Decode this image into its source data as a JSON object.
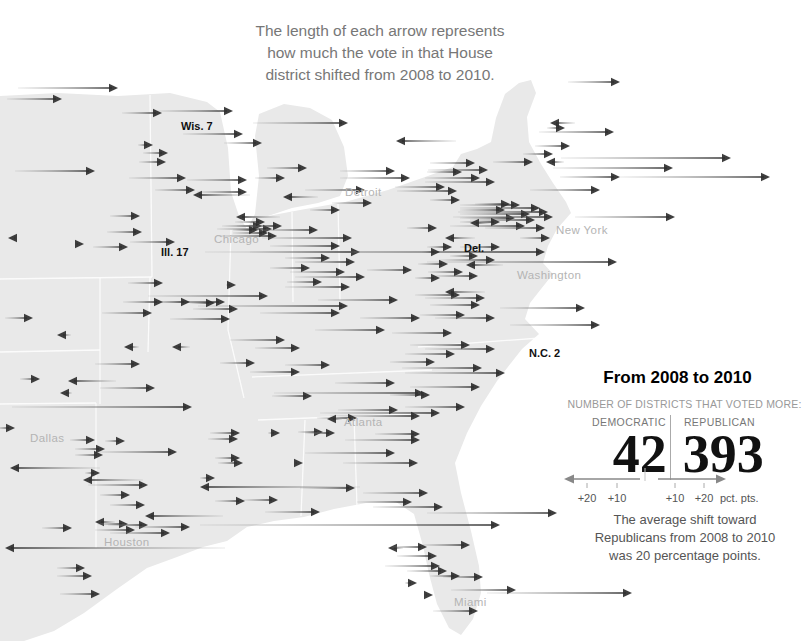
{
  "annotation": {
    "title": "The length of each arrow represents\nhow much the vote in that House\ndistrict shifted from 2008 to 2010."
  },
  "map": {
    "cities": [
      {
        "name": "Detroit",
        "x": 345,
        "y": 186
      },
      {
        "name": "Chicago",
        "x": 214,
        "y": 233
      },
      {
        "name": "New York",
        "x": 556,
        "y": 224
      },
      {
        "name": "Washington",
        "x": 517,
        "y": 269
      },
      {
        "name": "Atlanta",
        "x": 344,
        "y": 416
      },
      {
        "name": "Dallas",
        "x": 30,
        "y": 432
      },
      {
        "name": "Houston",
        "x": 104,
        "y": 536
      },
      {
        "name": "Miami",
        "x": 454,
        "y": 596
      }
    ],
    "districts": [
      {
        "name": "Wis. 7",
        "x": 181,
        "y": 120
      },
      {
        "name": "Ill. 17",
        "x": 161,
        "y": 246
      },
      {
        "name": "Del.",
        "x": 464,
        "y": 242
      },
      {
        "name": "N.C. 2",
        "x": 529,
        "y": 347
      }
    ]
  },
  "arrows": [
    [
      118,
      88,
      100,
      "R"
    ],
    [
      62,
      99,
      55,
      "R"
    ],
    [
      233,
      111,
      76,
      "R"
    ],
    [
      162,
      113,
      40,
      "R"
    ],
    [
      348,
      123,
      95,
      "R"
    ],
    [
      550,
      123,
      25,
      "L"
    ],
    [
      620,
      82,
      52,
      "R"
    ],
    [
      243,
      134,
      60,
      "R"
    ],
    [
      262,
      143,
      38,
      "R"
    ],
    [
      153,
      145,
      15,
      "R"
    ],
    [
      396,
      141,
      60,
      "L"
    ],
    [
      614,
      132,
      75,
      "R"
    ],
    [
      565,
      128,
      18,
      "R"
    ],
    [
      570,
      146,
      35,
      "R"
    ],
    [
      95,
      171,
      80,
      "R"
    ],
    [
      168,
      153,
      25,
      "R"
    ],
    [
      166,
      162,
      27,
      "R"
    ],
    [
      553,
      154,
      30,
      "R"
    ],
    [
      731,
      158,
      170,
      "R"
    ],
    [
      673,
      168,
      120,
      "R"
    ],
    [
      770,
      177,
      150,
      "R"
    ],
    [
      620,
      177,
      60,
      "R"
    ],
    [
      546,
      162,
      18,
      "L"
    ],
    [
      186,
      178,
      57,
      "R"
    ],
    [
      247,
      180,
      60,
      "R"
    ],
    [
      307,
      168,
      40,
      "R"
    ],
    [
      285,
      178,
      30,
      "R"
    ],
    [
      395,
      171,
      55,
      "R"
    ],
    [
      410,
      178,
      70,
      "R"
    ],
    [
      533,
      162,
      40,
      "R"
    ],
    [
      475,
      163,
      45,
      "R"
    ],
    [
      488,
      170,
      60,
      "R"
    ],
    [
      462,
      172,
      35,
      "R"
    ],
    [
      480,
      178,
      55,
      "R"
    ],
    [
      495,
      182,
      70,
      "R"
    ],
    [
      445,
      187,
      50,
      "R"
    ],
    [
      457,
      191,
      60,
      "R"
    ],
    [
      195,
      190,
      40,
      "R"
    ],
    [
      247,
      192,
      50,
      "R"
    ],
    [
      193,
      195,
      57,
      "L"
    ],
    [
      283,
      197,
      35,
      "L"
    ],
    [
      365,
      190,
      60,
      "R"
    ],
    [
      600,
      190,
      70,
      "R"
    ],
    [
      372,
      203,
      40,
      "R"
    ],
    [
      340,
      210,
      30,
      "R"
    ],
    [
      675,
      217,
      100,
      "R"
    ],
    [
      520,
      205,
      60,
      "R"
    ],
    [
      540,
      208,
      80,
      "R"
    ],
    [
      505,
      210,
      45,
      "R"
    ],
    [
      530,
      214,
      70,
      "R"
    ],
    [
      548,
      212,
      90,
      "R"
    ],
    [
      515,
      218,
      55,
      "R"
    ],
    [
      535,
      220,
      65,
      "R"
    ],
    [
      500,
      222,
      40,
      "R"
    ],
    [
      525,
      226,
      75,
      "R"
    ],
    [
      545,
      228,
      60,
      "R"
    ],
    [
      510,
      204,
      35,
      "R"
    ],
    [
      553,
      217,
      100,
      "R"
    ],
    [
      470,
      223,
      20,
      "L"
    ],
    [
      445,
      238,
      30,
      "L"
    ],
    [
      460,
      200,
      30,
      "R"
    ],
    [
      437,
      228,
      30,
      "R"
    ],
    [
      550,
      238,
      30,
      "R"
    ],
    [
      236,
      217,
      44,
      "L"
    ],
    [
      140,
      216,
      30,
      "R"
    ],
    [
      142,
      232,
      35,
      "R"
    ],
    [
      175,
      242,
      45,
      "R"
    ],
    [
      262,
      226,
      40,
      "R"
    ],
    [
      272,
      229,
      55,
      "R"
    ],
    [
      268,
      233,
      35,
      "R"
    ],
    [
      277,
      236,
      60,
      "R"
    ],
    [
      258,
      230,
      25,
      "R"
    ],
    [
      282,
      226,
      45,
      "R"
    ],
    [
      265,
      222,
      30,
      "R"
    ],
    [
      318,
      230,
      60,
      "R"
    ],
    [
      352,
      238,
      90,
      "R"
    ],
    [
      340,
      246,
      70,
      "R"
    ],
    [
      360,
      252,
      110,
      "R"
    ],
    [
      545,
      252,
      340,
      "R"
    ],
    [
      617,
      262,
      190,
      "R"
    ],
    [
      8,
      238,
      8,
      "L"
    ],
    [
      84,
      244,
      8,
      "R"
    ],
    [
      128,
      247,
      35,
      "R"
    ],
    [
      33,
      318,
      28,
      "R"
    ],
    [
      330,
      258,
      45,
      "R"
    ],
    [
      355,
      262,
      60,
      "R"
    ],
    [
      310,
      268,
      40,
      "R"
    ],
    [
      345,
      272,
      55,
      "R"
    ],
    [
      365,
      277,
      70,
      "R"
    ],
    [
      322,
      282,
      35,
      "R"
    ],
    [
      350,
      287,
      65,
      "R"
    ],
    [
      412,
      270,
      45,
      "R"
    ],
    [
      268,
      296,
      120,
      "R"
    ],
    [
      348,
      306,
      150,
      "R"
    ],
    [
      225,
      302,
      80,
      "R"
    ],
    [
      466,
      265,
      37,
      "L"
    ],
    [
      478,
      256,
      28,
      "R"
    ],
    [
      500,
      247,
      40,
      "R"
    ],
    [
      495,
      260,
      55,
      "R"
    ],
    [
      452,
      247,
      25,
      "R"
    ],
    [
      440,
      252,
      18,
      "R"
    ],
    [
      448,
      264,
      30,
      "R"
    ],
    [
      463,
      272,
      35,
      "R"
    ],
    [
      478,
      276,
      45,
      "R"
    ],
    [
      440,
      278,
      25,
      "R"
    ],
    [
      445,
      292,
      40,
      "L"
    ],
    [
      460,
      295,
      45,
      "R"
    ],
    [
      485,
      298,
      60,
      "R"
    ],
    [
      585,
      308,
      85,
      "R"
    ],
    [
      600,
      325,
      90,
      "R"
    ],
    [
      480,
      305,
      50,
      "R"
    ],
    [
      465,
      315,
      45,
      "R"
    ],
    [
      495,
      318,
      60,
      "R"
    ],
    [
      163,
      283,
      35,
      "R"
    ],
    [
      236,
      285,
      10,
      "R"
    ],
    [
      163,
      302,
      40,
      "R"
    ],
    [
      190,
      302,
      30,
      "R"
    ],
    [
      215,
      303,
      25,
      "R"
    ],
    [
      152,
      313,
      50,
      "R"
    ],
    [
      238,
      309,
      45,
      "R"
    ],
    [
      230,
      319,
      60,
      "R"
    ],
    [
      57,
      335,
      14,
      "L"
    ],
    [
      124,
      347,
      15,
      "L"
    ],
    [
      172,
      347,
      18,
      "L"
    ],
    [
      140,
      364,
      45,
      "R"
    ],
    [
      40,
      379,
      20,
      "R"
    ],
    [
      68,
      381,
      48,
      "L"
    ],
    [
      60,
      393,
      12,
      "L"
    ],
    [
      155,
      388,
      55,
      "R"
    ],
    [
      192,
      407,
      180,
      "R"
    ],
    [
      398,
      300,
      80,
      "R"
    ],
    [
      340,
      313,
      80,
      "R"
    ],
    [
      420,
      318,
      60,
      "R"
    ],
    [
      385,
      330,
      70,
      "R"
    ],
    [
      452,
      333,
      60,
      "R"
    ],
    [
      285,
      340,
      55,
      "R"
    ],
    [
      300,
      348,
      45,
      "R"
    ],
    [
      255,
      363,
      35,
      "R"
    ],
    [
      330,
      365,
      45,
      "R"
    ],
    [
      300,
      372,
      50,
      "R"
    ],
    [
      470,
      345,
      60,
      "R"
    ],
    [
      495,
      349,
      70,
      "R"
    ],
    [
      455,
      354,
      50,
      "R"
    ],
    [
      435,
      362,
      45,
      "R"
    ],
    [
      482,
      368,
      80,
      "R"
    ],
    [
      505,
      373,
      100,
      "R"
    ],
    [
      480,
      387,
      70,
      "R"
    ],
    [
      430,
      395,
      40,
      "R"
    ],
    [
      465,
      407,
      60,
      "R"
    ],
    [
      395,
      383,
      60,
      "R"
    ],
    [
      424,
      393,
      150,
      "R"
    ],
    [
      312,
      396,
      40,
      "R"
    ],
    [
      440,
      413,
      120,
      "R"
    ],
    [
      420,
      416,
      90,
      "R"
    ],
    [
      398,
      410,
      60,
      "R"
    ],
    [
      357,
      418,
      40,
      "R"
    ],
    [
      327,
      419,
      15,
      "L"
    ],
    [
      323,
      432,
      25,
      "R"
    ],
    [
      335,
      433,
      30,
      "R"
    ],
    [
      420,
      434,
      45,
      "R"
    ],
    [
      395,
      453,
      90,
      "R"
    ],
    [
      303,
      463,
      8,
      "R"
    ],
    [
      418,
      463,
      75,
      "R"
    ],
    [
      420,
      440,
      75,
      "R"
    ],
    [
      280,
      433,
      12,
      "R"
    ],
    [
      240,
      433,
      30,
      "R"
    ],
    [
      15,
      428,
      18,
      "R"
    ],
    [
      95,
      440,
      25,
      "R"
    ],
    [
      125,
      441,
      20,
      "R"
    ],
    [
      105,
      449,
      30,
      "R"
    ],
    [
      103,
      455,
      28,
      "R"
    ],
    [
      177,
      452,
      80,
      "R"
    ],
    [
      238,
      439,
      30,
      "R"
    ],
    [
      240,
      458,
      25,
      "R"
    ],
    [
      10,
      468,
      90,
      "L"
    ],
    [
      100,
      473,
      15,
      "R"
    ],
    [
      83,
      480,
      60,
      "L"
    ],
    [
      148,
      485,
      60,
      "R"
    ],
    [
      200,
      487,
      160,
      "L"
    ],
    [
      130,
      495,
      30,
      "R"
    ],
    [
      215,
      478,
      15,
      "R"
    ],
    [
      243,
      463,
      25,
      "R"
    ],
    [
      355,
      488,
      55,
      "R"
    ],
    [
      428,
      493,
      65,
      "R"
    ],
    [
      278,
      500,
      35,
      "R"
    ],
    [
      245,
      501,
      30,
      "R"
    ],
    [
      412,
      502,
      55,
      "R"
    ],
    [
      443,
      507,
      70,
      "R"
    ],
    [
      320,
      512,
      55,
      "R"
    ],
    [
      557,
      513,
      130,
      "R"
    ],
    [
      500,
      525,
      300,
      "R"
    ],
    [
      145,
      505,
      35,
      "R"
    ],
    [
      145,
      516,
      78,
      "L"
    ],
    [
      95,
      522,
      20,
      "L"
    ],
    [
      128,
      524,
      30,
      "R"
    ],
    [
      148,
      525,
      40,
      "R"
    ],
    [
      190,
      527,
      55,
      "R"
    ],
    [
      135,
      530,
      40,
      "R"
    ],
    [
      170,
      533,
      60,
      "R"
    ],
    [
      72,
      528,
      30,
      "R"
    ],
    [
      5,
      548,
      220,
      "L"
    ],
    [
      85,
      568,
      28,
      "R"
    ],
    [
      92,
      576,
      35,
      "R"
    ],
    [
      100,
      594,
      40,
      "R"
    ],
    [
      470,
      545,
      50,
      "R"
    ],
    [
      388,
      548,
      15,
      "L"
    ],
    [
      427,
      547,
      35,
      "R"
    ],
    [
      437,
      556,
      40,
      "R"
    ],
    [
      440,
      566,
      55,
      "R"
    ],
    [
      447,
      571,
      40,
      "R"
    ],
    [
      483,
      577,
      40,
      "R"
    ],
    [
      460,
      576,
      30,
      "R"
    ],
    [
      417,
      583,
      12,
      "R"
    ],
    [
      516,
      590,
      65,
      "R"
    ],
    [
      632,
      593,
      145,
      "R"
    ],
    [
      433,
      595,
      8,
      "R"
    ],
    [
      478,
      611,
      45,
      "R"
    ]
  ],
  "panel": {
    "title": "From 2008 to 2010",
    "subtitle": "NUMBER OF DISTRICTS THAT VOTED MORE:",
    "dem_label": "DEMOCRATIC",
    "rep_label": "REPUBLICAN",
    "dem_value": "42",
    "rep_value": "393",
    "scale": {
      "left20": "+20",
      "left10": "+10",
      "right10": "+10",
      "right20": "+20",
      "unit": "pct. pts."
    },
    "note": "The average shift toward\nRepublicans from 2008 to 2010\nwas 20 percentage points."
  },
  "chart_data": {
    "type": "map_arrows",
    "title": "The length of each arrow represents how much the vote in that House district shifted from 2008 to 2010.",
    "period": "From 2008 to 2010",
    "summary": {
      "districts_voted_more_democratic": 42,
      "districts_voted_more_republican": 393,
      "average_shift_toward_republicans_pct_pts": 20
    },
    "arrow_semantics": {
      "right": "shift toward Republicans",
      "left": "shift toward Democrats"
    },
    "scale": {
      "unit": "pct. pts.",
      "ticks": [
        10,
        20
      ]
    },
    "labeled_districts": [
      "Wis. 7",
      "Ill. 17",
      "Del.",
      "N.C. 2"
    ],
    "labeled_cities": [
      "Detroit",
      "Chicago",
      "New York",
      "Washington",
      "Atlanta",
      "Dallas",
      "Houston",
      "Miami"
    ]
  }
}
